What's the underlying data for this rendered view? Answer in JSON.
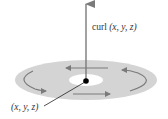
{
  "diagram": {
    "type": "vector-field-curl-illustration",
    "labels": {
      "curl_prefix": "curl ",
      "curl_args": "(x, y, z)",
      "point": "(x, y, z)"
    },
    "colors": {
      "disk": "#d4d4d4",
      "disk_center": "#ffffff",
      "arrow": "#7a7a7a",
      "point": "#000000",
      "text": "#333333",
      "leader_line": "#222222"
    },
    "elements": {
      "curl_vector": {
        "from": [
          86,
          81
        ],
        "to": [
          86,
          3
        ]
      },
      "point": {
        "cx": 86,
        "cy": 81,
        "r": 3
      },
      "disk": {
        "cx": 86,
        "cy": 80,
        "rx": 71,
        "ry": 20
      },
      "disk_center": {
        "cx": 86,
        "cy": 80,
        "rx": 17,
        "ry": 6
      },
      "circulation_arrows": 4
    }
  }
}
